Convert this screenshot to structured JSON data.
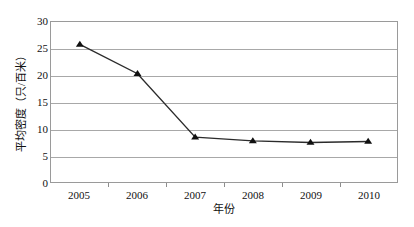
{
  "chart_data": {
    "type": "line",
    "title": "",
    "subtitle": "",
    "xlabel": "年份",
    "ylabel": "平均密度（只/百米）",
    "categories": [
      "2005",
      "2006",
      "2007",
      "2008",
      "2009",
      "2010"
    ],
    "values": [
      25.8,
      20.3,
      8.4,
      7.7,
      7.4,
      7.6
    ],
    "series": [
      {
        "name": "平均密度",
        "values": [
          25.8,
          20.3,
          8.4,
          7.7,
          7.4,
          7.6
        ],
        "marker": "triangle-up",
        "marker_color": "#101010",
        "line_color": "#2b2b2b"
      }
    ],
    "ylim": [
      0,
      30
    ],
    "yticks": [
      0,
      5,
      10,
      15,
      20,
      25,
      30
    ],
    "ytick_labels": [
      "0",
      "5",
      "10",
      "15",
      "20",
      "25",
      "30"
    ],
    "xtick_labels": [
      "2005",
      "2006",
      "2007",
      "2008",
      "2009",
      "2010"
    ],
    "grid": "horizontal",
    "legend": "none",
    "plot_border_color": "#9a9a9a",
    "gridline_color": "#a8a8a8",
    "background_color": "#ffffff"
  }
}
